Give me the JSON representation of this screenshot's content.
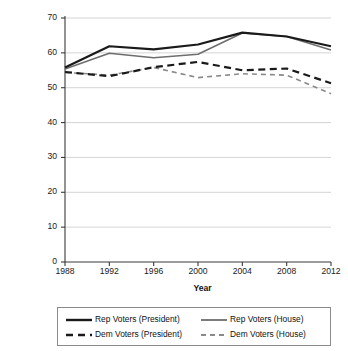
{
  "chart_data": {
    "type": "line",
    "title": "",
    "xlabel": "Year",
    "ylabel": "Mean Feeling Thermometer Score for \"Christian Fundamentalists\"",
    "x": [
      1988,
      1992,
      1996,
      2000,
      2004,
      2008,
      2012
    ],
    "categories": [
      "1988",
      "1992",
      "1996",
      "2000",
      "2004",
      "2008",
      "2012"
    ],
    "xlim": [
      1988,
      2012
    ],
    "ylim": [
      0,
      70
    ],
    "yticks": [
      0,
      10,
      20,
      30,
      40,
      50,
      60,
      70
    ],
    "ytick_labels": [
      "0",
      "10",
      "20",
      "30",
      "40",
      "50",
      "60",
      "70"
    ],
    "grid": true,
    "grid_axis": "y",
    "legend_position": "below",
    "series": [
      {
        "name": "Rep Voters (President)",
        "values": [
          55.8,
          61.9,
          61.0,
          62.4,
          65.8,
          64.7,
          61.9
        ],
        "color": "#1a1a1a",
        "style": "solid",
        "width": 2.2
      },
      {
        "name": "Rep Voters (House)",
        "values": [
          55.4,
          59.9,
          58.6,
          59.6,
          65.7,
          64.7,
          60.8
        ],
        "color": "#6e6e6e",
        "style": "solid",
        "width": 1.6
      },
      {
        "name": "Dem Voters (President)",
        "values": [
          54.5,
          53.3,
          55.9,
          57.4,
          55.0,
          55.5,
          51.3
        ],
        "color": "#1a1a1a",
        "style": "dashed",
        "width": 2.2
      },
      {
        "name": "Dem Voters (House)",
        "values": [
          54.4,
          53.6,
          55.8,
          52.9,
          54.0,
          53.6,
          48.3
        ],
        "color": "#8a8a8a",
        "style": "dashed",
        "width": 1.6
      }
    ]
  },
  "axes": {
    "ylabel": "Mean Feeling Thermometer Score for \"Christian Fundamentalists\"",
    "xlabel": "Year"
  },
  "legend": {
    "items": [
      {
        "label": "Rep Voters (President)"
      },
      {
        "label": "Rep Voters (House)"
      },
      {
        "label": "Dem Voters (President)"
      },
      {
        "label": "Dem Voters (House)"
      }
    ]
  }
}
